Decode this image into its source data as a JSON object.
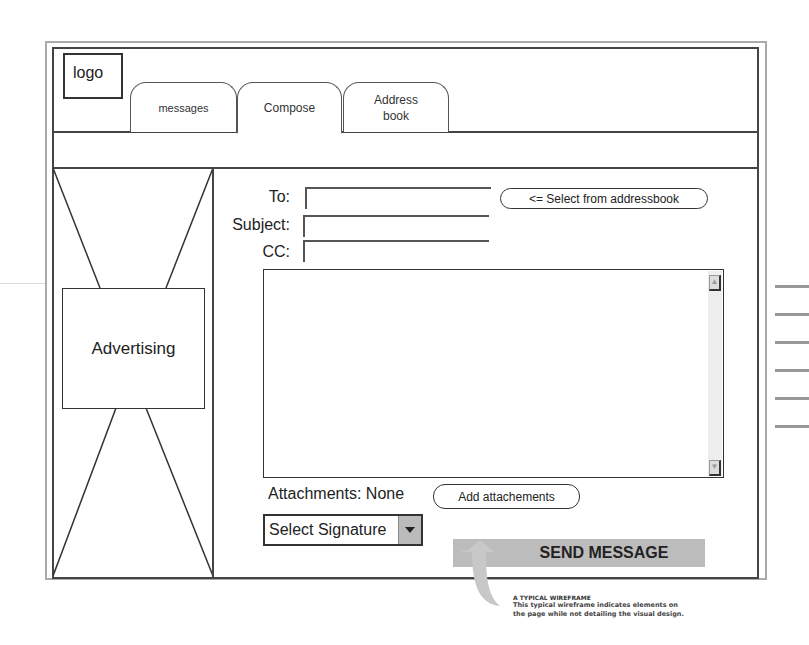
{
  "header": {
    "logo": "logo",
    "tabs": [
      {
        "label": "messages",
        "active": false
      },
      {
        "label": "Compose",
        "active": true
      },
      {
        "label": "Address book",
        "active": false
      }
    ]
  },
  "sidebar": {
    "ad_label": "Advertising"
  },
  "compose": {
    "to_label": "To:",
    "to_value": "",
    "subject_label": "Subject:",
    "subject_value": "",
    "cc_label": "CC:",
    "cc_value": "",
    "select_addressbook_label": "<= Select from addressbook",
    "body_value": "",
    "attachments_label": "Attachments: None",
    "add_attachments_label": "Add attachements",
    "signature_select": "Select Signature",
    "send_label": "SEND MESSAGE"
  },
  "caption": {
    "title": "A TYPICAL WIREFRAME",
    "line1": "This  typical wireframe indicates elements on",
    "line2": "the page while not detailing the visual design."
  },
  "colors": {
    "frame_outer": "#aaaaaa",
    "frame_inner": "#444444",
    "send_button": "#bcbcbc",
    "arrow": "#c8c8c8"
  }
}
